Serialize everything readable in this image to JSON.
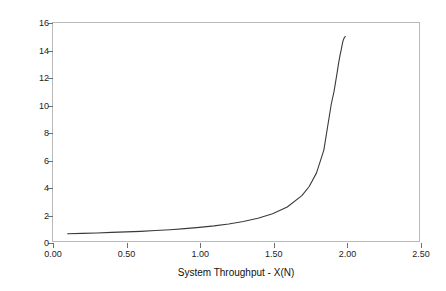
{
  "chart_data": {
    "type": "line",
    "title": "",
    "xlabel": "System Throughput - X(N)",
    "ylabel": "Response Time - R(N)",
    "xlim": [
      0.0,
      2.5
    ],
    "ylim": [
      0,
      16
    ],
    "xticks": [
      "0.00",
      "0.50",
      "1.00",
      "1.50",
      "2.00",
      "2.50"
    ],
    "xtick_values": [
      0.0,
      0.5,
      1.0,
      1.5,
      2.0,
      2.5
    ],
    "yticks": [
      "0",
      "2",
      "4",
      "6",
      "8",
      "10",
      "12",
      "14",
      "16"
    ],
    "ytick_values": [
      0,
      2,
      4,
      6,
      8,
      10,
      12,
      14,
      16
    ],
    "grid": false,
    "legend": false,
    "legend_position": "none",
    "asymptote_x": 2.0,
    "line_color": "#3a3a3a",
    "axis_color": "#b9b9b9",
    "series": [
      {
        "name": "Response Time - R(N)",
        "x": [
          0.1,
          0.2,
          0.3,
          0.4,
          0.5,
          0.6,
          0.7,
          0.8,
          0.9,
          1.0,
          1.1,
          1.2,
          1.3,
          1.4,
          1.5,
          1.6,
          1.7,
          1.75,
          1.8,
          1.85,
          1.9,
          1.92,
          1.94,
          1.95,
          1.96,
          1.97,
          1.975,
          1.98,
          1.985,
          1.99,
          1.993,
          1.9966
        ],
        "y": [
          0.53,
          0.56,
          0.59,
          0.63,
          0.67,
          0.71,
          0.77,
          0.83,
          0.91,
          1.0,
          1.11,
          1.25,
          1.43,
          1.67,
          2.0,
          2.5,
          3.33,
          4.0,
          5.0,
          6.67,
          10.0,
          11.0,
          12.3,
          13.0,
          13.6,
          14.1,
          14.4,
          14.65,
          14.8,
          14.93,
          14.97,
          15.0
        ]
      }
    ]
  },
  "axis": {
    "x": {
      "label": "System Throughput - X(N)",
      "ticks": [
        {
          "value": 0.0,
          "text": "0.00"
        },
        {
          "value": 0.5,
          "text": "0.50"
        },
        {
          "value": 1.0,
          "text": "1.00"
        },
        {
          "value": 1.5,
          "text": "1.50"
        },
        {
          "value": 2.0,
          "text": "2.00"
        },
        {
          "value": 2.5,
          "text": "2.50"
        }
      ]
    },
    "y": {
      "label": "Response Time - R(N)",
      "ticks": [
        {
          "value": 0,
          "text": "0"
        },
        {
          "value": 2,
          "text": "2"
        },
        {
          "value": 4,
          "text": "4"
        },
        {
          "value": 6,
          "text": "6"
        },
        {
          "value": 8,
          "text": "8"
        },
        {
          "value": 10,
          "text": "10"
        },
        {
          "value": 12,
          "text": "12"
        },
        {
          "value": 14,
          "text": "14"
        },
        {
          "value": 16,
          "text": "16"
        }
      ]
    }
  }
}
